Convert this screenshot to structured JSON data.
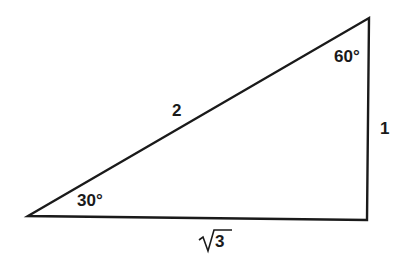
{
  "diagram": {
    "type": "right-triangle",
    "colors": {
      "stroke": "#1a1a1a",
      "background": "#ffffff",
      "text": "#1a1a1a"
    },
    "vertices": {
      "left": {
        "x": 28,
        "y": 216
      },
      "top_right": {
        "x": 369,
        "y": 18
      },
      "bottom_right": {
        "x": 367,
        "y": 220
      }
    },
    "angles": {
      "left": "30°",
      "top_right": "60°"
    },
    "sides": {
      "hypotenuse": "2",
      "vertical": "1",
      "base_radicand": "3",
      "base_symbol": "√"
    }
  }
}
